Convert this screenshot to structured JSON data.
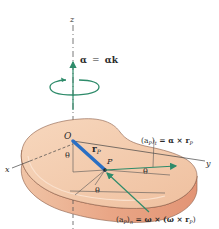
{
  "diagram": {
    "type": "rigid-body-rotation",
    "axes": {
      "x": "x",
      "y": "y",
      "z": "z"
    },
    "angular_acceleration": {
      "symbol": "α",
      "equals": "=",
      "rhs_scalar": "α",
      "rhs_unit": "k"
    },
    "origin_label": "O",
    "point_label": "P",
    "position_vector": {
      "symbol": "r",
      "subscript": "P"
    },
    "angle_labels": [
      "θ",
      "θ",
      "θ"
    ],
    "tangential_accel": {
      "lhs": "(a",
      "lhs_sub": "P",
      "lhs_close": ")",
      "lhs_sub2": "t",
      "rhs": " = α × r",
      "rhs_sub": "P"
    },
    "normal_accel": {
      "lhs": "(a",
      "lhs_sub": "P",
      "lhs_close": ")",
      "lhs_sub2": "n",
      "rhs": " = ω × (ω × r",
      "rhs_sub": "P",
      "rhs_close": ")"
    },
    "colors": {
      "disk_top": "#f2c9a8",
      "disk_side": "#e8a383",
      "vector_green": "#2e8b6a",
      "position_blue": "#2a6fc4",
      "axis": "#444444"
    }
  }
}
